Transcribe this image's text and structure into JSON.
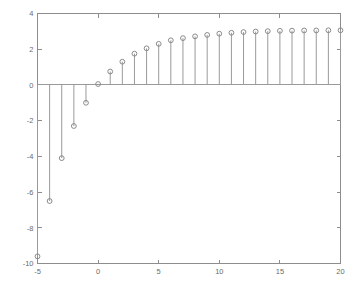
{
  "chart_data": {
    "type": "scatter",
    "plot_style": "stem",
    "title": "",
    "subtitle": "",
    "xlabel": "",
    "ylabel": "",
    "grid": false,
    "legend": null,
    "xlim": [
      -5,
      20
    ],
    "ylim": [
      -10,
      4
    ],
    "xticks": [
      -5,
      0,
      5,
      10,
      15,
      20
    ],
    "xticklabels": [
      "-5",
      "0",
      "5",
      "10",
      "15",
      "20"
    ],
    "yticks": [
      4,
      2,
      0,
      -2,
      -4,
      -6,
      -8,
      -10
    ],
    "yticklabels": [
      "4",
      "2",
      "0",
      "-2",
      "-4",
      "-6",
      "-8",
      "-10"
    ],
    "baseline": 0,
    "marker": "circle-open",
    "x": [
      -5,
      -4,
      -3,
      -2,
      -1,
      0,
      1,
      2,
      3,
      4,
      5,
      6,
      7,
      8,
      9,
      10,
      11,
      12,
      13,
      14,
      15,
      16,
      17,
      18,
      19,
      20
    ],
    "values": [
      -9.6,
      -6.5,
      -4.1,
      -2.3,
      -1.0,
      0.05,
      0.75,
      1.3,
      1.75,
      2.05,
      2.3,
      2.5,
      2.62,
      2.72,
      2.8,
      2.87,
      2.92,
      2.96,
      2.99,
      3.01,
      3.03,
      3.04,
      3.05,
      3.05,
      3.06,
      3.06
    ],
    "colors": {
      "marker": "#8a8a8a",
      "stem": "#9a9a9a",
      "axis": "#8d8d8d",
      "text": "#6b6b6b",
      "background": "#ffffff"
    }
  },
  "figure": {
    "background": "#ffffff"
  }
}
